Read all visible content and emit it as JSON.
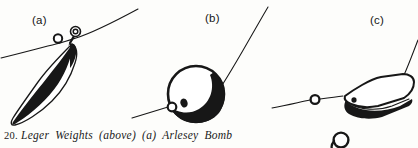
{
  "figure": {
    "caption_number": "20.",
    "caption_text": "Leger Weights (above) (a) Arlesey Bomb",
    "ink_color": "#171717",
    "paper_color": "#fdfdfb",
    "panels": [
      {
        "key": "a",
        "label": "(a)",
        "item_name": "Arlesey Bomb",
        "description": "Pear-shaped leger weight with swivel at the top, threaded on line with bead",
        "parts": [
          "fishing-line",
          "line-bead",
          "swivel-ring",
          "bomb-body",
          "bomb-shading"
        ]
      },
      {
        "key": "b",
        "label": "(b)",
        "item_name": "Drilled Bullet",
        "description": "Spherical drilled bullet leger weight on line with stop bead",
        "parts": [
          "fishing-line",
          "line-bead",
          "bullet-body",
          "bullet-shading",
          "bullet-hole"
        ]
      },
      {
        "key": "c",
        "label": "(c)",
        "item_name": "Flat Leger Weight",
        "description": "Flat hexagonal coffin-shaped leger weight on line with stop bead, ring below",
        "parts": [
          "fishing-line",
          "line-bead",
          "flat-weight-body",
          "flat-weight-edge",
          "flat-weight-hole",
          "loose-ring"
        ]
      }
    ]
  }
}
